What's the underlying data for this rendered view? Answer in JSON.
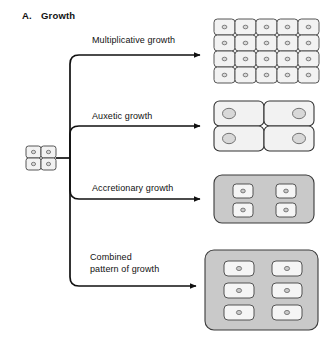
{
  "figure": {
    "panel_letter": "A.",
    "panel_title": "Growth",
    "background_color": "#ffffff",
    "line_color": "#111111"
  },
  "colors": {
    "cell_fill": "#f2f2f2",
    "cell_stroke": "#444444",
    "nucleus_fill": "#d8d8d8",
    "nucleus_stroke": "#555555",
    "matrix_fill": "#c9c9c9",
    "matrix_stroke": "#3a3a3a",
    "inner_cell_fill": "#f5f5f5",
    "connector": "#111111"
  },
  "source": {
    "name": "starting-cell-cluster",
    "columns": 2,
    "rows": 2,
    "cell_count": 4
  },
  "branches": [
    {
      "id": "multiplicative",
      "label": "Multiplicative growth",
      "diagram": {
        "type": "cell-grid",
        "columns": 5,
        "rows": 4,
        "cell_count": 20,
        "has_matrix": false,
        "cell_size": "small"
      }
    },
    {
      "id": "auxetic",
      "label": "Auxetic growth",
      "diagram": {
        "type": "cell-grid",
        "columns": 2,
        "rows": 2,
        "cell_count": 4,
        "has_matrix": false,
        "cell_size": "large"
      }
    },
    {
      "id": "accretionary",
      "label": "Accretionary growth",
      "diagram": {
        "type": "matrix-with-cells",
        "columns": 2,
        "rows": 2,
        "cell_count": 4,
        "has_matrix": true,
        "cell_size": "small"
      }
    },
    {
      "id": "combined",
      "label": "Combined\npattern of growth",
      "label_line_1": "Combined",
      "label_line_2": "pattern of growth",
      "diagram": {
        "type": "matrix-with-cells",
        "columns": 2,
        "rows": 3,
        "cell_count": 6,
        "has_matrix": true,
        "cell_size": "medium"
      }
    }
  ]
}
